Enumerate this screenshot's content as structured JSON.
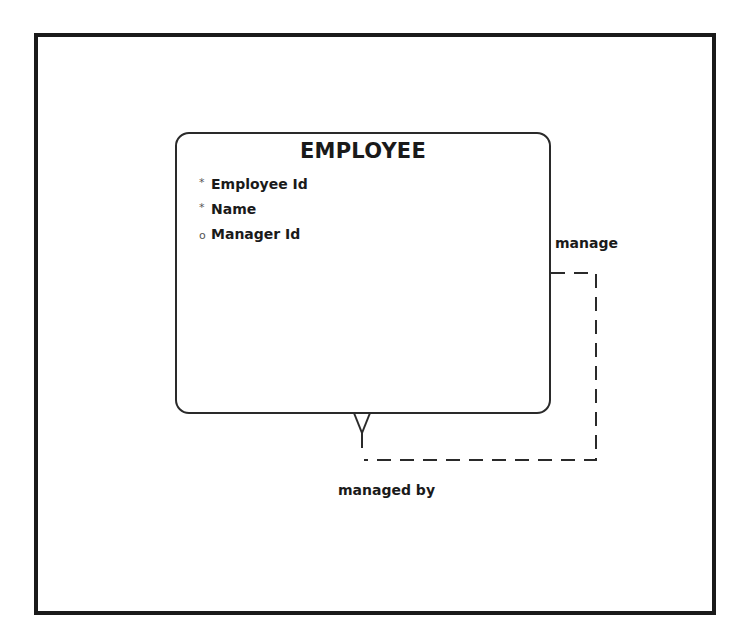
{
  "diagram": {
    "type": "entity-relationship",
    "entity": {
      "name": "EMPLOYEE",
      "attributes": [
        {
          "marker": "*",
          "marker_type": "mandatory",
          "name": "Employee Id"
        },
        {
          "marker": "*",
          "marker_type": "mandatory",
          "name": "Name"
        },
        {
          "marker": "o",
          "marker_type": "optional",
          "name": "Manager Id"
        }
      ]
    },
    "relationship": {
      "kind": "recursive",
      "line_style": "dashed",
      "start_label": "manage",
      "end_label": "managed by",
      "end_cardinality": "crow-foot-many"
    }
  },
  "colors": {
    "frame": "#1a1a1a",
    "entity_border": "#2a2a2a",
    "line": "#2a2a2a",
    "background": "#ffffff"
  }
}
